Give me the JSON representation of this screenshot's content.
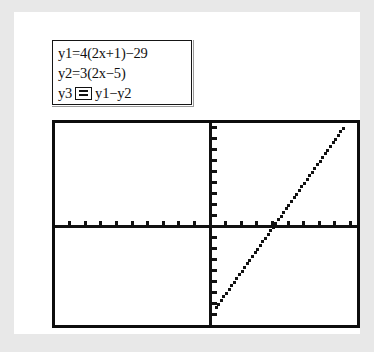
{
  "app": {
    "type": "graphing-calculator-screen",
    "background_color": "#e8e8e8",
    "card_color": "#ffffff",
    "ink_color": "#111111"
  },
  "equation_box": {
    "name": "equation-editor",
    "lines": [
      {
        "id": "y1",
        "text": "y1=4(2x+1)−29",
        "has_op_box": false
      },
      {
        "id": "y2",
        "text": "y2=3(2x−5)",
        "has_op_box": false
      },
      {
        "id": "y3",
        "prefix": "y3",
        "op": "=",
        "expression": "y1−y2",
        "has_op_box": true
      }
    ]
  },
  "graph": {
    "name": "graph-viewport",
    "frame_color": "#0d0d0d",
    "axis_color": "#111111",
    "curve_color": "#111111",
    "origin_px": {
      "x": 155,
      "y": 103
    },
    "x_tick_spacing_px": 15.6,
    "y_tick_spacing_px": 11.0
  },
  "chart_data": {
    "type": "line",
    "title": "",
    "xlabel": "",
    "ylabel": "",
    "grid": false,
    "legend": "none",
    "axes": {
      "x_axis_visible": true,
      "y_axis_visible": true,
      "x_ticks_count_left": 10,
      "x_ticks_count_right": 9,
      "y_ticks_count_up": 9,
      "y_ticks_count_down": 8,
      "x_tick_step": 1,
      "y_tick_step": 1
    },
    "xlim": [
      -10,
      9.8
    ],
    "ylim": [
      -9.5,
      9.5
    ],
    "series": [
      {
        "name": "y3 = y1 - y2",
        "equation": "y = 2x - 8",
        "slope": 2,
        "intercept": -8,
        "x_intercept": 4,
        "x": [
          0.3,
          1,
          2,
          3,
          4,
          5,
          6,
          7,
          8,
          9,
          9.5
        ],
        "y": [
          -7.4,
          -6,
          -4,
          -2,
          0,
          2,
          4,
          6,
          8,
          9.3,
          9.4
        ],
        "style": "pixelated-dotted"
      }
    ],
    "annotations": [
      {
        "text": "y1=4(2x+1)−29"
      },
      {
        "text": "y2=3(2x−5)"
      },
      {
        "text": "y3 = y1−y2"
      }
    ]
  }
}
